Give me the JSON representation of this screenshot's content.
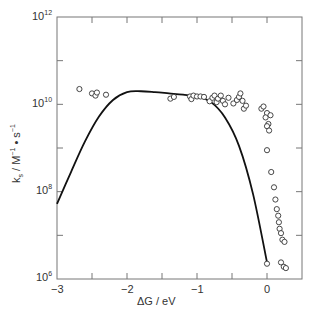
{
  "chart_data": {
    "type": "scatter",
    "title": "",
    "xlabel": "ΔG / eV",
    "ylabel": "ks / M⁻¹ • s⁻¹",
    "xlim": [
      -3,
      0.45
    ],
    "ylim_log10": [
      6,
      12
    ],
    "yscale": "log",
    "grid": false,
    "x_ticks": [
      -3,
      -2,
      -1,
      0
    ],
    "x_tick_labels": [
      "−3",
      "−2",
      "−1",
      "0"
    ],
    "y_ticks_log10": [
      6,
      8,
      10,
      12
    ],
    "y_tick_labels": [
      "10^6",
      "10^8",
      "10^10",
      "10^12"
    ],
    "series": [
      {
        "name": "experimental",
        "style": "open-circles",
        "points_log10": [
          [
            -2.68,
            10.35
          ],
          [
            -2.5,
            10.25
          ],
          [
            -2.45,
            10.2
          ],
          [
            -2.43,
            10.27
          ],
          [
            -2.3,
            10.22
          ],
          [
            -1.38,
            10.13
          ],
          [
            -1.33,
            10.17
          ],
          [
            -1.1,
            10.18
          ],
          [
            -1.08,
            10.12
          ],
          [
            -1.05,
            10.2
          ],
          [
            -1.0,
            10.18
          ],
          [
            -0.95,
            10.18
          ],
          [
            -0.9,
            10.17
          ],
          [
            -0.82,
            10.07
          ],
          [
            -0.78,
            10.15
          ],
          [
            -0.75,
            10.2
          ],
          [
            -0.72,
            10.05
          ],
          [
            -0.7,
            10.13
          ],
          [
            -0.66,
            10.2
          ],
          [
            -0.63,
            10.08
          ],
          [
            -0.6,
            10.0
          ],
          [
            -0.55,
            10.15
          ],
          [
            -0.48,
            10.02
          ],
          [
            -0.43,
            10.1
          ],
          [
            -0.4,
            10.17
          ],
          [
            -0.38,
            10.25
          ],
          [
            -0.35,
            10.08
          ],
          [
            -0.33,
            9.9
          ],
          [
            -0.3,
            9.97
          ],
          [
            -0.08,
            9.9
          ],
          [
            -0.05,
            9.95
          ],
          [
            0.0,
            9.8
          ],
          [
            -0.02,
            9.7
          ],
          [
            0.05,
            9.75
          ],
          [
            0.02,
            9.55
          ],
          [
            0.0,
            9.5
          ],
          [
            0.03,
            9.4
          ],
          [
            0.0,
            8.95
          ],
          [
            0.06,
            8.45
          ],
          [
            0.1,
            8.1
          ],
          [
            0.12,
            7.82
          ],
          [
            0.14,
            7.6
          ],
          [
            0.16,
            7.45
          ],
          [
            0.17,
            7.3
          ],
          [
            0.18,
            7.15
          ],
          [
            0.2,
            7.05
          ],
          [
            0.22,
            6.9
          ],
          [
            0.25,
            6.85
          ],
          [
            0.0,
            6.35
          ],
          [
            0.2,
            6.38
          ],
          [
            0.24,
            6.28
          ],
          [
            0.27,
            6.25
          ]
        ]
      },
      {
        "name": "theory",
        "style": "solid-line",
        "points_log10": [
          [
            -3.0,
            7.72
          ],
          [
            -2.8,
            8.45
          ],
          [
            -2.6,
            9.15
          ],
          [
            -2.4,
            9.72
          ],
          [
            -2.2,
            10.1
          ],
          [
            -2.0,
            10.28
          ],
          [
            -1.8,
            10.3
          ],
          [
            -1.6,
            10.28
          ],
          [
            -1.4,
            10.25
          ],
          [
            -1.2,
            10.22
          ],
          [
            -1.0,
            10.18
          ],
          [
            -0.8,
            10.05
          ],
          [
            -0.6,
            9.7
          ],
          [
            -0.4,
            9.05
          ],
          [
            -0.2,
            7.95
          ],
          [
            0.0,
            6.38
          ]
        ]
      }
    ]
  },
  "axes": {
    "x_title": "ΔG / eV",
    "y_title_k": "k",
    "y_title_sub": "s",
    "y_title_mid": " / M",
    "y_title_sup1": "−1",
    "y_title_dot": " • s",
    "y_title_sup2": "−1",
    "y_base": "10",
    "y_exp": [
      "6",
      "8",
      "10",
      "12"
    ],
    "x_labels": [
      "−3",
      "−2",
      "−1",
      "0"
    ]
  }
}
